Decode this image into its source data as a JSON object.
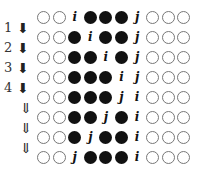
{
  "diagram": {
    "rows": [
      {
        "label": "",
        "arrow": "",
        "cells": [
          "o",
          "o",
          "i",
          "f",
          "f",
          "f",
          "j",
          "o",
          "o",
          "o"
        ]
      },
      {
        "label": "1",
        "arrow": "solid",
        "cells": [
          "o",
          "o",
          "f",
          "i",
          "f",
          "f",
          "j",
          "o",
          "o",
          "o"
        ]
      },
      {
        "label": "2",
        "arrow": "solid",
        "cells": [
          "o",
          "o",
          "f",
          "f",
          "i",
          "f",
          "j",
          "o",
          "o",
          "o"
        ]
      },
      {
        "label": "3",
        "arrow": "solid",
        "cells": [
          "o",
          "o",
          "f",
          "f",
          "f",
          "i",
          "j",
          "o",
          "o",
          "o"
        ]
      },
      {
        "label": "4",
        "arrow": "solid",
        "cells": [
          "o",
          "o",
          "f",
          "f",
          "f",
          "j",
          "i",
          "o",
          "o",
          "o"
        ]
      },
      {
        "label": "",
        "arrow": "hollow",
        "cells": [
          "o",
          "o",
          "f",
          "f",
          "j",
          "f",
          "i",
          "o",
          "o",
          "o"
        ]
      },
      {
        "label": "",
        "arrow": "hollow",
        "cells": [
          "o",
          "o",
          "f",
          "j",
          "f",
          "f",
          "i",
          "o",
          "o",
          "o"
        ]
      },
      {
        "label": "",
        "arrow": "hollow",
        "cells": [
          "o",
          "o",
          "j",
          "f",
          "f",
          "f",
          "i",
          "o",
          "o",
          "o"
        ]
      }
    ],
    "glyphs": {
      "solid": "⬇",
      "hollow": "⇓"
    }
  }
}
